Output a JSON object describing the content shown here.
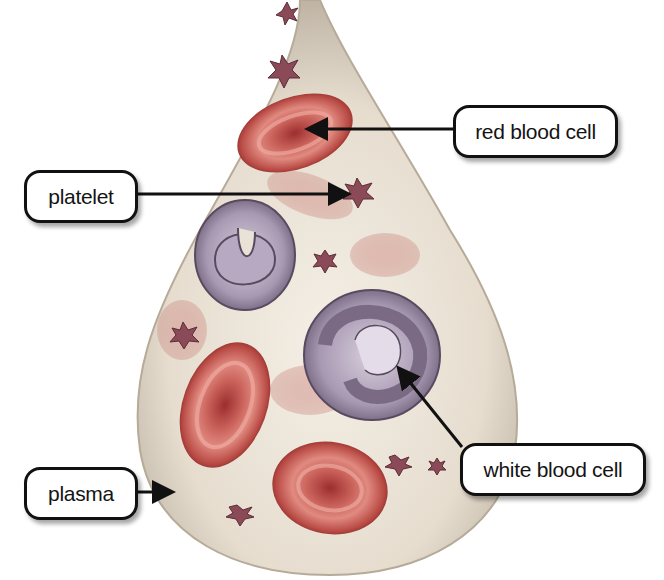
{
  "diagram": {
    "labels": [
      {
        "id": "red-blood-cell",
        "text": "red blood cell"
      },
      {
        "id": "platelet",
        "text": "platelet"
      },
      {
        "id": "white-blood-cell",
        "text": "white blood cell"
      },
      {
        "id": "plasma",
        "text": "plasma"
      }
    ]
  },
  "colors": {
    "red_cell": "#b8413f",
    "red_cell_dark": "#7e2222",
    "white_cell": "#9c8fa8",
    "platelet": "#8a4a58",
    "plasma": "#e9e2d6",
    "arrow": "#111111"
  }
}
